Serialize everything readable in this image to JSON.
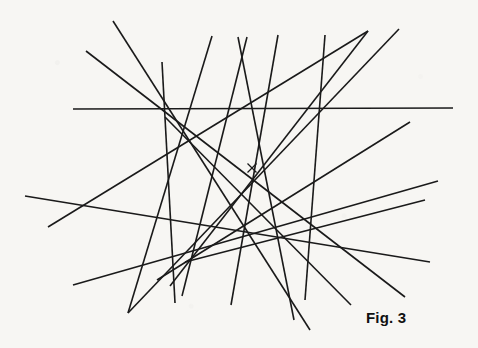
{
  "figure": {
    "caption": "Fig. 3",
    "background_color": "#f7f6f3",
    "line_color": "#1a1a1a",
    "line_width": 1.6,
    "width": 478,
    "height": 348,
    "center_mark": {
      "name": "center-cross",
      "label": "×",
      "x": 252,
      "y": 168,
      "size": 9
    },
    "envelope_circle": {
      "cx": 252,
      "cy": 168,
      "r": 62,
      "visible": false
    },
    "lines": [
      {
        "id": "line-01",
        "x1": 73,
        "y1": 109,
        "x2": 453,
        "y2": 108
      },
      {
        "id": "line-02",
        "x1": 113,
        "y1": 21,
        "x2": 310,
        "y2": 330
      },
      {
        "id": "line-03",
        "x1": 86,
        "y1": 51,
        "x2": 405,
        "y2": 297
      },
      {
        "id": "line-04",
        "x1": 25,
        "y1": 196,
        "x2": 430,
        "y2": 262
      },
      {
        "id": "line-05",
        "x1": 48,
        "y1": 227,
        "x2": 368,
        "y2": 31
      },
      {
        "id": "line-06",
        "x1": 73,
        "y1": 285,
        "x2": 438,
        "y2": 181
      },
      {
        "id": "line-07",
        "x1": 128,
        "y1": 313,
        "x2": 399,
        "y2": 29
      },
      {
        "id": "line-08",
        "x1": 162,
        "y1": 62,
        "x2": 175,
        "y2": 303
      },
      {
        "id": "line-09",
        "x1": 212,
        "y1": 36,
        "x2": 128,
        "y2": 313
      },
      {
        "id": "line-10",
        "x1": 238,
        "y1": 37,
        "x2": 294,
        "y2": 320
      },
      {
        "id": "line-11",
        "x1": 247,
        "y1": 37,
        "x2": 182,
        "y2": 296
      },
      {
        "id": "line-12",
        "x1": 278,
        "y1": 35,
        "x2": 231,
        "y2": 305
      },
      {
        "id": "line-13",
        "x1": 325,
        "y1": 35,
        "x2": 305,
        "y2": 300
      },
      {
        "id": "line-14",
        "x1": 368,
        "y1": 31,
        "x2": 170,
        "y2": 286
      },
      {
        "id": "line-15",
        "x1": 410,
        "y1": 122,
        "x2": 157,
        "y2": 280
      },
      {
        "id": "line-16",
        "x1": 425,
        "y1": 200,
        "x2": 185,
        "y2": 262
      },
      {
        "id": "line-17",
        "x1": 351,
        "y1": 305,
        "x2": 165,
        "y2": 117
      }
    ]
  }
}
